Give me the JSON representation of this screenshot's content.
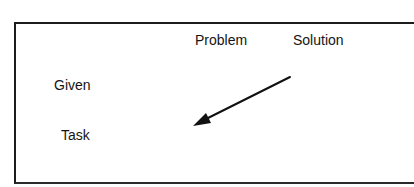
{
  "diagram": {
    "column_headers": [
      "Problem",
      "Solution"
    ],
    "row_labels": [
      "Given",
      "Task"
    ],
    "arrow": {
      "from": "Solution / Given",
      "to": "Problem / Task",
      "direction": "down-left",
      "color": "#111111"
    },
    "colors": {
      "border": "#1c1c1c",
      "text": "#141414",
      "background": "#ffffff"
    }
  }
}
